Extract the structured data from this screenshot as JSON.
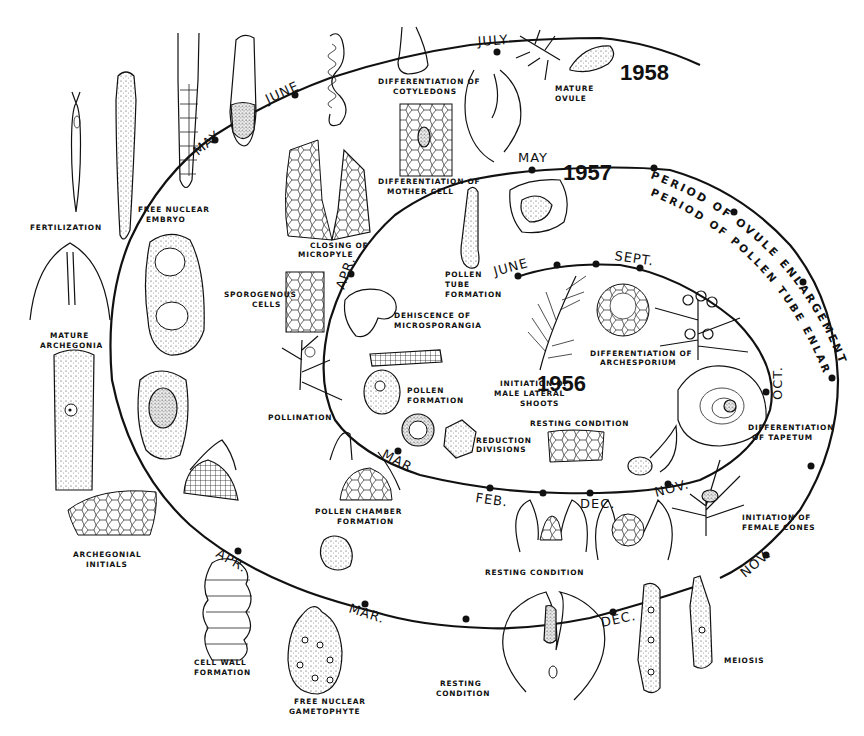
{
  "figure": {
    "years": [
      "1956",
      "1957",
      "1958"
    ],
    "periods": {
      "outer": "PERIOD OF OVULE ENLARGEMENT",
      "middle": "PERIOD OF POLLEN TUBE ENLARGEMENT"
    }
  },
  "spiral": {
    "inner_1956": {
      "months": [
        "JUNE",
        "SEPT.",
        "OCT.",
        "NOV.",
        "DEC.",
        "FEB.",
        "MAR.",
        "APR."
      ],
      "year_label": "1956"
    },
    "middle_1957": {
      "months": [
        "MAY"
      ],
      "year_label": "1957"
    },
    "outer_1957_1958": {
      "months": [
        "NOV.",
        "DEC.",
        "MAR.",
        "APR.",
        "MAY",
        "JUNE",
        "JULY"
      ],
      "year_label": "1958"
    }
  },
  "labels": {
    "fertilization": "FERTILIZATION",
    "free_nuclear_embryo_1": "FREE NUCLEAR",
    "free_nuclear_embryo_2": "EMBRYO",
    "differentiation_cotyledons_1": "DIFFERENTIATION OF",
    "differentiation_cotyledons_2": "COTYLEDONS",
    "mature_ovule_1": "MATURE",
    "mature_ovule_2": "OVULE",
    "differentiation_mother_cell_1": "DIFFERENTIATION OF",
    "differentiation_mother_cell_2": "MOTHER CELL",
    "closing_micropyle_1": "CLOSING OF",
    "closing_micropyle_2": "MICROPYLE",
    "pollen_tube_formation_1": "POLLEN",
    "pollen_tube_formation_2": "TUBE",
    "pollen_tube_formation_3": "FORMATION",
    "sporogenous_cells_1": "SPOROGENOUS",
    "sporogenous_cells_2": "CELLS",
    "dehiscence_1": "DEHISCENCE OF",
    "dehiscence_2": "MICROSPORANGIA",
    "mature_archegonia_1": "MATURE",
    "mature_archegonia_2": "ARCHEGONIA",
    "pollination": "POLLINATION",
    "pollen_formation_1": "POLLEN",
    "pollen_formation_2": "FORMATION",
    "reduction_divisions_1": "REDUCTION",
    "reduction_divisions_2": "DIVISIONS",
    "initiation_male_1": "INITIATION OF",
    "initiation_male_2": "MALE LATERAL",
    "initiation_male_3": "SHOOTS",
    "differentiation_archesporium_1": "DIFFERENTIATION OF",
    "differentiation_archesporium_2": "ARCHESPORIUM",
    "resting_condition_inner": "RESTING CONDITION",
    "differentiation_tapetum_1": "DIFFERENTIATION",
    "differentiation_tapetum_2": "OF TAPETUM",
    "pollen_chamber_1": "POLLEN CHAMBER",
    "pollen_chamber_2": "FORMATION",
    "archegonial_initials_1": "ARCHEGONIAL",
    "archegonial_initials_2": "INITIALS",
    "resting_condition_middle": "RESTING CONDITION",
    "initiation_female_1": "INITIATION OF",
    "initiation_female_2": "FEMALE CONES",
    "cell_wall_1": "CELL WALL",
    "cell_wall_2": "FORMATION",
    "free_nuclear_gametophyte_1": "FREE NUCLEAR",
    "free_nuclear_gametophyte_2": "GAMETOPHYTE",
    "resting_condition_outer_1": "RESTING",
    "resting_condition_outer_2": "CONDITION",
    "meiosis": "MEIOSIS"
  },
  "month_labels": {
    "inner_june": "JUNE",
    "inner_sept": "SEPT.",
    "inner_oct": "OCT.",
    "inner_nov": "NOV.",
    "inner_dec": "DEC.",
    "inner_feb": "FEB.",
    "inner_mar": "MAR.",
    "inner_apr": "APR.",
    "mid_may": "MAY",
    "outer_nov": "NOV.",
    "outer_dec": "DEC.",
    "outer_mar": "MAR.",
    "outer_apr": "APR.",
    "outer_may": "MAY",
    "outer_june": "JUNE",
    "outer_july": "JULY"
  },
  "year_labels": {
    "y1956": "1956",
    "y1957": "1957",
    "y1958": "1958"
  },
  "period_labels": {
    "ovule": "PERIOD OF OVULE ENLARGEMENT",
    "pollen": "PERIOD OF POLLEN TUBE ENLARGEMENT"
  },
  "colors": {
    "ink": "#111111",
    "paper": "#ffffff"
  }
}
